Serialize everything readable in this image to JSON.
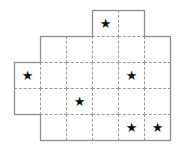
{
  "grid": {
    "cell_size": 26,
    "origin_x": 14,
    "origin_y": 10,
    "columns": 6,
    "rows": 5,
    "star_symbol": "★",
    "line_color": "#9a9a9a",
    "outline_color": "#8c8c8c",
    "star_color": "#111111",
    "cells": [
      {
        "row": 0,
        "col": 3,
        "star": true
      },
      {
        "row": 0,
        "col": 4,
        "star": false
      },
      {
        "row": 1,
        "col": 1,
        "star": false
      },
      {
        "row": 1,
        "col": 2,
        "star": false
      },
      {
        "row": 1,
        "col": 3,
        "star": false
      },
      {
        "row": 1,
        "col": 4,
        "star": false
      },
      {
        "row": 1,
        "col": 5,
        "star": false
      },
      {
        "row": 2,
        "col": 0,
        "star": true
      },
      {
        "row": 2,
        "col": 1,
        "star": false
      },
      {
        "row": 2,
        "col": 2,
        "star": false
      },
      {
        "row": 2,
        "col": 3,
        "star": false
      },
      {
        "row": 2,
        "col": 4,
        "star": true
      },
      {
        "row": 2,
        "col": 5,
        "star": false
      },
      {
        "row": 3,
        "col": 0,
        "star": false
      },
      {
        "row": 3,
        "col": 1,
        "star": false
      },
      {
        "row": 3,
        "col": 2,
        "star": true
      },
      {
        "row": 3,
        "col": 3,
        "star": false
      },
      {
        "row": 3,
        "col": 4,
        "star": false
      },
      {
        "row": 3,
        "col": 5,
        "star": false
      },
      {
        "row": 4,
        "col": 1,
        "star": false
      },
      {
        "row": 4,
        "col": 2,
        "star": false
      },
      {
        "row": 4,
        "col": 3,
        "star": false
      },
      {
        "row": 4,
        "col": 4,
        "star": true
      },
      {
        "row": 4,
        "col": 5,
        "star": true
      }
    ]
  }
}
